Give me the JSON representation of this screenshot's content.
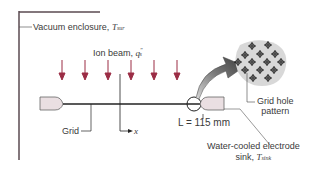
{
  "labels": {
    "enclosure": "Vacuum enclosure, ",
    "enclosure_sym": "T",
    "enclosure_sub": "sur",
    "ion_beam": "Ion beam, ",
    "ion_beam_sym": "q",
    "ion_beam_sub": "s",
    "ion_beam_sup": "″",
    "grid": "Grid",
    "x_axis": "x",
    "length": "L = 115 mm",
    "sink_line1": "Water-cooled electrode",
    "sink_line2": "sink, ",
    "sink_sym": "T",
    "sink_sub": "sink",
    "pattern_line1": "Grid hole",
    "pattern_line2": "pattern"
  },
  "colors": {
    "arrow": "#9b2d45",
    "line": "#222222",
    "enclosure": "#5a4a50",
    "electrode_fill": "#eadfe2",
    "pattern_bg": "#d6d6d6"
  },
  "beam_arrows": 7
}
